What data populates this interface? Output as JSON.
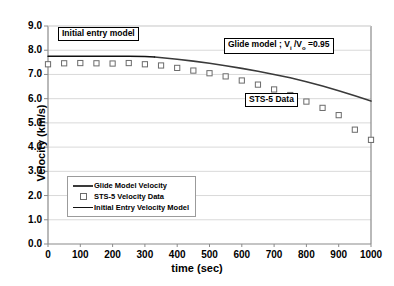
{
  "chart_data": {
    "type": "line",
    "title": "",
    "xlabel": "time (sec)",
    "ylabel": "Velocity (km/s)",
    "xlim": [
      0,
      1000
    ],
    "ylim": [
      0,
      9
    ],
    "xticks": [
      "0",
      "100",
      "200",
      "300",
      "400",
      "500",
      "600",
      "700",
      "800",
      "900",
      "1000"
    ],
    "yticks": [
      "0.0",
      "1.0",
      "2.0",
      "3.0",
      "4.0",
      "5.0",
      "6.0",
      "7.0",
      "8.0",
      "9.0"
    ],
    "grid": "horizontal",
    "legend_position": "lower-left-inside",
    "series": [
      {
        "name": "Glide Model Velocity",
        "style": "line",
        "color": "#3a3a3a",
        "x": [
          330,
          400,
          450,
          500,
          550,
          600,
          650,
          700,
          750,
          800,
          850,
          900,
          950,
          1000
        ],
        "values": [
          7.72,
          7.63,
          7.55,
          7.46,
          7.36,
          7.25,
          7.13,
          7.0,
          6.86,
          6.7,
          6.52,
          6.33,
          6.12,
          5.9
        ]
      },
      {
        "name": "Initial Entry Velocity Model",
        "style": "line",
        "color": "#111111",
        "x": [
          0,
          50,
          100,
          150,
          200,
          250,
          300,
          330
        ],
        "values": [
          7.75,
          7.75,
          7.75,
          7.75,
          7.75,
          7.75,
          7.74,
          7.72
        ]
      },
      {
        "name": "STS-5 Velocity Data",
        "style": "markers",
        "marker": "open-square",
        "color": "#6b6b6b",
        "x": [
          0,
          50,
          100,
          150,
          200,
          250,
          300,
          350,
          400,
          450,
          500,
          550,
          600,
          650,
          700,
          750,
          800,
          850,
          900,
          950,
          1000
        ],
        "values": [
          7.42,
          7.46,
          7.47,
          7.46,
          7.45,
          7.47,
          7.42,
          7.37,
          7.27,
          7.16,
          7.05,
          6.92,
          6.75,
          6.58,
          6.38,
          6.15,
          5.88,
          5.62,
          5.32,
          4.72,
          4.3
        ]
      }
    ],
    "annotations": [
      {
        "name": "initial-entry-model-callout",
        "text": "Initial entry model"
      },
      {
        "name": "glide-model-callout",
        "text_prefix": "Glide model ; V",
        "sub1": "i",
        "text_mid": " /V",
        "sub2": "o",
        "text_suffix": " =0.95"
      },
      {
        "name": "sts5-data-callout",
        "text": "STS-5 Data"
      }
    ]
  },
  "legend": {
    "items": [
      {
        "label": "Glide Model Velocity",
        "key": "line"
      },
      {
        "label": "STS-5 Velocity Data",
        "key": "marker"
      },
      {
        "label": "Initial Entry Velocity Model",
        "key": "thin"
      }
    ]
  }
}
